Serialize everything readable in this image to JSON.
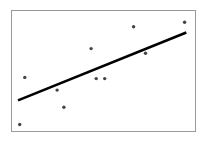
{
  "chart_data": {
    "type": "scatter",
    "title": "",
    "xlabel": "",
    "ylabel": "",
    "xlim": [
      0,
      10
    ],
    "ylim": [
      0,
      10
    ],
    "grid": false,
    "legend": null,
    "series": [
      {
        "name": "observations",
        "kind": "scatter",
        "color": "#444444",
        "points": [
          {
            "x": 0.1,
            "y": 0.3
          },
          {
            "x": 0.4,
            "y": 4.4
          },
          {
            "x": 2.3,
            "y": 3.3
          },
          {
            "x": 2.7,
            "y": 1.8
          },
          {
            "x": 4.3,
            "y": 6.9
          },
          {
            "x": 4.6,
            "y": 4.3
          },
          {
            "x": 5.1,
            "y": 4.3
          },
          {
            "x": 6.8,
            "y": 8.8
          },
          {
            "x": 7.5,
            "y": 6.5
          },
          {
            "x": 9.8,
            "y": 9.2
          }
        ]
      },
      {
        "name": "regression-line",
        "kind": "line",
        "color": "#000000",
        "points": [
          {
            "x": 0.0,
            "y": 2.4
          },
          {
            "x": 9.9,
            "y": 8.3
          }
        ]
      }
    ]
  },
  "style": {
    "frame_color": "#999999",
    "point_color": "#444444",
    "line_color": "#000000"
  }
}
